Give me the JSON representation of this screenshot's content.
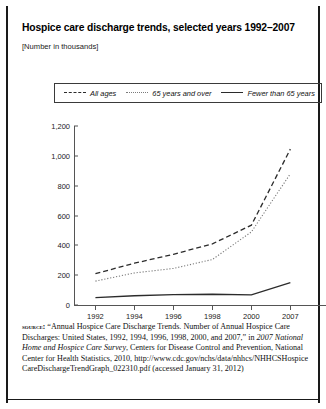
{
  "title": "Hospice care discharge trends, selected years 1992–2007",
  "units_note": "[Number in thousands]",
  "legend": {
    "items": [
      {
        "label": "All ages",
        "style": "dashed",
        "color": "#2b2b2b"
      },
      {
        "label": "65 years and over",
        "style": "dotted",
        "color": "#7a7a7a"
      },
      {
        "label": "Fewer than 65 years",
        "style": "solid",
        "color": "#2b2b2b"
      }
    ]
  },
  "source": {
    "keyword": "source:",
    "text_1": " “Annual Hospice Care Discharge Trends. Number of Annual Hospice Care Discharges: United States, 1992, 1994, 1996, 1998, 2000, and 2007,” in ",
    "italic_1": "2007 National Home and Hospice Care Survey",
    "text_2": ", Centers for Disease Control and Prevention, National Center for Health Statistics, 2010, http://www.cdc.gov/nchs/data/nhhcs/NHHCSHospice CareDischargeTrendGraph_022310.pdf (accessed January 31, 2012)"
  },
  "chart_data": {
    "type": "line",
    "title": "Hospice care discharge trends, selected years 1992–2007",
    "subtitle": "[Number in thousands]",
    "xlabel": "",
    "ylabel": "",
    "ylim": [
      0,
      1200
    ],
    "yticks": [
      0,
      200,
      400,
      600,
      800,
      1000,
      1200
    ],
    "ytick_labels": [
      "0",
      "200",
      "400",
      "600",
      "800",
      "1,000",
      "1,200"
    ],
    "categories": [
      "1992",
      "1994",
      "1996",
      "1998",
      "2000",
      "2007"
    ],
    "grid": false,
    "legend_position": "top",
    "series": [
      {
        "name": "All ages",
        "style": "dashed",
        "color": "#2b2b2b",
        "values": [
          210,
          280,
          340,
          410,
          535,
          1045
        ]
      },
      {
        "name": "65 years and over",
        "style": "dotted",
        "color": "#7a7a7a",
        "values": [
          160,
          215,
          245,
          305,
          490,
          880
        ]
      },
      {
        "name": "Fewer than 65 years",
        "style": "solid",
        "color": "#2b2b2b",
        "values": [
          50,
          62,
          70,
          72,
          68,
          150
        ]
      }
    ]
  }
}
